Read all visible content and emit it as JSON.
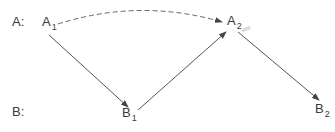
{
  "rows": {
    "a": {
      "label": "A:"
    },
    "b": {
      "label": "B:"
    }
  },
  "nodes": {
    "a1": {
      "base": "A",
      "sub": "1"
    },
    "a2": {
      "base": "A",
      "sub": "2"
    },
    "b1": {
      "base": "B",
      "sub": "1"
    },
    "b2": {
      "base": "B",
      "sub": "2"
    }
  },
  "edges": [
    {
      "from": "A1",
      "to": "A2",
      "style": "dashed-curve"
    },
    {
      "from": "A1",
      "to": "B1",
      "style": "solid-arrow"
    },
    {
      "from": "B1",
      "to": "A2",
      "style": "solid-arrow"
    },
    {
      "from": "A2",
      "to": "B2",
      "style": "solid-arrow"
    }
  ],
  "colors": {
    "stroke": "#555555",
    "text": "#3a3a3a"
  }
}
